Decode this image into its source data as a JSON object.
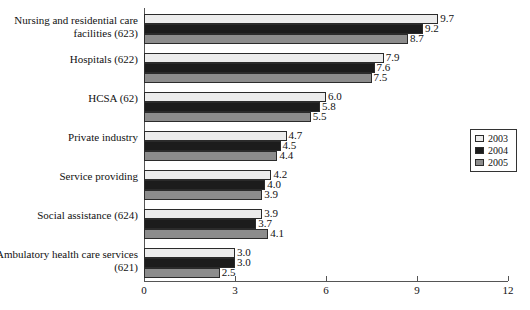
{
  "chart_data": {
    "type": "bar",
    "orientation": "horizontal",
    "title": "",
    "subtitle": "",
    "xlabel": "",
    "ylabel": "",
    "xlim": [
      0,
      12
    ],
    "xticks": [
      "0",
      "3",
      "6",
      "9",
      "12"
    ],
    "xtick_values": [
      0,
      3,
      6,
      9,
      12
    ],
    "grid": false,
    "legend_position": "right",
    "categories": [
      "Nursing and residential care facilities (623)",
      "Hospitals (622)",
      "HCSA (62)",
      "Private industry",
      "Service providing",
      "Social assistance (624)",
      "Ambulatory health care services (621)"
    ],
    "series": [
      {
        "name": "2003",
        "color": "#ececec",
        "values": [
          9.7,
          7.9,
          6.0,
          4.7,
          4.2,
          3.9,
          3.0
        ],
        "labels": [
          "9.7",
          "7.9",
          "6.0",
          "4.7",
          "4.2",
          "3.9",
          "3.0"
        ]
      },
      {
        "name": "2004",
        "color": "#1c1c1c",
        "values": [
          9.2,
          7.6,
          5.8,
          4.5,
          4.0,
          3.7,
          3.0
        ],
        "labels": [
          "9.2",
          "7.6",
          "5.8",
          "4.5",
          "4.0",
          "3.7",
          "3.0"
        ]
      },
      {
        "name": "2005",
        "color": "#8c8c8c",
        "values": [
          8.7,
          7.5,
          5.5,
          4.4,
          3.9,
          4.1,
          2.5
        ],
        "labels": [
          "8.7",
          "7.5",
          "5.5",
          "4.4",
          "3.9",
          "4.1",
          "2.5"
        ]
      }
    ]
  },
  "legend": {
    "items": [
      {
        "label": "2003",
        "swatch": "y2003"
      },
      {
        "label": "2004",
        "swatch": "y2004"
      },
      {
        "label": "2005",
        "swatch": "y2005"
      }
    ]
  }
}
